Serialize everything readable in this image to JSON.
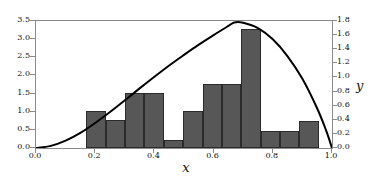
{
  "chart_data": {
    "type": "bar",
    "title": "",
    "xlabel": "x",
    "ylabel": "",
    "ylabel_right": "y",
    "xlim": [
      0.0,
      1.0
    ],
    "ylim": [
      0.0,
      3.5
    ],
    "ylim_right": [
      0.0,
      1.8
    ],
    "grid": false,
    "legend": null,
    "xticks": [
      "0.0",
      "0.2",
      "0.4",
      "0.6",
      "0.8",
      "1.0"
    ],
    "xtick_values": [
      0.0,
      0.2,
      0.4,
      0.6,
      0.8,
      1.0
    ],
    "yticks_left": [
      "0.0",
      "0.5",
      "1.0",
      "1.5",
      "2.0",
      "2.5",
      "3.0",
      "3.5"
    ],
    "ytick_values_left": [
      0.0,
      0.5,
      1.0,
      1.5,
      2.0,
      2.5,
      3.0,
      3.5
    ],
    "yticks_right": [
      "0.0",
      "0.2",
      "0.4",
      "0.6",
      "0.8",
      "1.0",
      "1.2",
      "1.4",
      "1.6",
      "1.8"
    ],
    "ytick_values_right": [
      0.0,
      0.2,
      0.4,
      0.6,
      0.8,
      1.0,
      1.2,
      1.4,
      1.6,
      1.8
    ],
    "histogram": {
      "bin_edges": [
        0.17,
        0.235,
        0.301,
        0.366,
        0.432,
        0.497,
        0.563,
        0.628,
        0.693,
        0.759,
        0.824,
        0.89,
        0.955
      ],
      "bin_width": 0.0654,
      "values": [
        1.02,
        0.76,
        1.51,
        0.23,
        1.02,
        1.77,
        1.77,
        3.28,
        0.48,
        0.75
      ],
      "bar_values": [
        1.02,
        0.76,
        1.51,
        0.23,
        1.02,
        1.77,
        1.77,
        1.77,
        3.28,
        0.48,
        0.75,
        0.75
      ],
      "bars": [
        {
          "x0": 0.17,
          "x1": 0.235,
          "height": 1.02
        },
        {
          "x0": 0.235,
          "x1": 0.301,
          "height": 0.76
        },
        {
          "x0": 0.301,
          "x1": 0.366,
          "height": 1.51
        },
        {
          "x0": 0.366,
          "x1": 0.432,
          "height": 1.51
        },
        {
          "x0": 0.432,
          "x1": 0.497,
          "height": 0.23
        },
        {
          "x0": 0.497,
          "x1": 0.563,
          "height": 1.02
        },
        {
          "x0": 0.563,
          "x1": 0.628,
          "height": 1.77
        },
        {
          "x0": 0.628,
          "x1": 0.693,
          "height": 1.77
        },
        {
          "x0": 0.693,
          "x1": 0.759,
          "height": 3.28
        },
        {
          "x0": 0.759,
          "x1": 0.824,
          "height": 0.48
        },
        {
          "x0": 0.824,
          "x1": 0.89,
          "height": 0.48
        },
        {
          "x0": 0.89,
          "x1": 0.955,
          "height": 0.75
        }
      ],
      "bar_color": "#575757",
      "edge_color": "#2b2b2b"
    },
    "curve": {
      "name": "density",
      "color": "#000000",
      "line_width": 2,
      "axis": "right",
      "peak_x": 0.67,
      "peak_y": 1.78,
      "points": [
        {
          "x": 0.0,
          "y": 0.0
        },
        {
          "x": 0.05,
          "y": 0.03
        },
        {
          "x": 0.1,
          "y": 0.105
        },
        {
          "x": 0.15,
          "y": 0.215
        },
        {
          "x": 0.2,
          "y": 0.355
        },
        {
          "x": 0.25,
          "y": 0.51
        },
        {
          "x": 0.3,
          "y": 0.675
        },
        {
          "x": 0.35,
          "y": 0.845
        },
        {
          "x": 0.4,
          "y": 1.01
        },
        {
          "x": 0.45,
          "y": 1.17
        },
        {
          "x": 0.5,
          "y": 1.32
        },
        {
          "x": 0.55,
          "y": 1.465
        },
        {
          "x": 0.6,
          "y": 1.6
        },
        {
          "x": 0.65,
          "y": 1.73
        },
        {
          "x": 0.67,
          "y": 1.78
        },
        {
          "x": 0.7,
          "y": 1.775
        },
        {
          "x": 0.75,
          "y": 1.7
        },
        {
          "x": 0.8,
          "y": 1.54
        },
        {
          "x": 0.85,
          "y": 1.3
        },
        {
          "x": 0.9,
          "y": 0.98
        },
        {
          "x": 0.95,
          "y": 0.56
        },
        {
          "x": 0.98,
          "y": 0.25
        },
        {
          "x": 1.0,
          "y": 0.0
        }
      ]
    }
  }
}
